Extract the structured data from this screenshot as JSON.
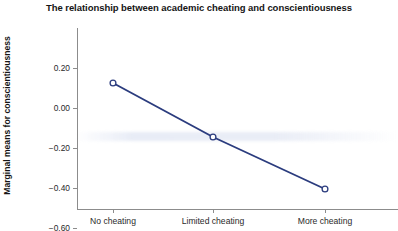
{
  "chart_data": {
    "type": "line",
    "title": "The relationship between academic cheating and conscientiousness",
    "xlabel": "",
    "ylabel": "Marginal means for conscientiousness",
    "categories": [
      "No cheating",
      "Limited cheating",
      "More cheating"
    ],
    "values": [
      0.125,
      -0.145,
      -0.405
    ],
    "series": [
      {
        "name": "Marginal means",
        "values": [
          0.125,
          -0.145,
          -0.405
        ]
      }
    ],
    "ylim": [
      -0.6,
      0.2
    ],
    "yticks": [
      0.2,
      0.0,
      -0.2,
      -0.4,
      -0.6
    ],
    "ytick_labels": [
      "0.20",
      "0.00",
      "−0.20",
      "−0.40",
      "−0.60"
    ],
    "grid": false,
    "legend": "none",
    "marker": "open-circle",
    "line_color": "#2b3c7e",
    "marker_edge_color": "#2b3c7e",
    "marker_face_color": "#ffffff",
    "axis_color": "#8c8c8c",
    "background": "#ffffff",
    "text_color": "#151515"
  }
}
